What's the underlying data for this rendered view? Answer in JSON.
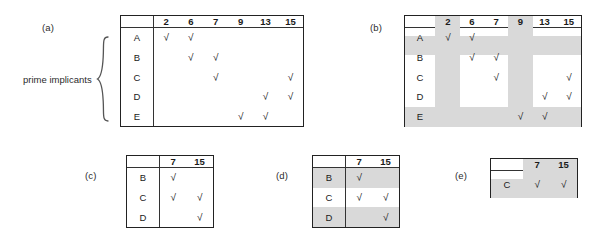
{
  "figure": {
    "side_label": "prime implicants",
    "panels": {
      "a": "(a)",
      "b": "(b)",
      "c": "(c)",
      "d": "(d)",
      "e": "(e)"
    }
  },
  "colors": {
    "highlight": "#d9d9d9",
    "border": "#222222",
    "text": "#1a1a1a"
  },
  "glyphs": {
    "check": "√"
  },
  "chart_data": {
    "type": "table",
    "tables": [
      {
        "id": "a",
        "label": "(a)",
        "corner": "",
        "columns": [
          "2",
          "6",
          "7",
          "9",
          "13",
          "15"
        ],
        "rows": [
          "A",
          "B",
          "C",
          "D",
          "E"
        ],
        "marks": [
          [
            1,
            1,
            0,
            0,
            0,
            0
          ],
          [
            0,
            1,
            1,
            0,
            0,
            0
          ],
          [
            0,
            0,
            1,
            0,
            0,
            1
          ],
          [
            0,
            0,
            0,
            0,
            1,
            1
          ],
          [
            0,
            0,
            0,
            1,
            1,
            0
          ]
        ],
        "highlight_columns": [],
        "highlight_rows": []
      },
      {
        "id": "b",
        "label": "(b)",
        "corner": "",
        "columns": [
          "2",
          "6",
          "7",
          "9",
          "13",
          "15"
        ],
        "rows": [
          "A",
          "B",
          "C",
          "D",
          "E"
        ],
        "marks": [
          [
            1,
            1,
            0,
            0,
            0,
            0
          ],
          [
            0,
            1,
            1,
            0,
            0,
            0
          ],
          [
            0,
            0,
            1,
            0,
            0,
            1
          ],
          [
            0,
            0,
            0,
            0,
            1,
            1
          ],
          [
            0,
            0,
            0,
            1,
            1,
            0
          ]
        ],
        "highlight_columns": [
          "2",
          "9"
        ],
        "highlight_rows": [
          "A",
          "E"
        ]
      },
      {
        "id": "c",
        "label": "(c)",
        "corner": "",
        "columns": [
          "7",
          "15"
        ],
        "rows": [
          "B",
          "C",
          "D"
        ],
        "marks": [
          [
            1,
            0
          ],
          [
            1,
            1
          ],
          [
            0,
            1
          ]
        ],
        "highlight_columns": [],
        "highlight_rows": []
      },
      {
        "id": "d",
        "label": "(d)",
        "corner": "",
        "columns": [
          "7",
          "15"
        ],
        "rows": [
          "B",
          "C",
          "D"
        ],
        "marks": [
          [
            1,
            0
          ],
          [
            1,
            1
          ],
          [
            0,
            1
          ]
        ],
        "highlight_columns": [],
        "highlight_rows": [
          "B",
          "D"
        ]
      },
      {
        "id": "e",
        "label": "(e)",
        "corner": "",
        "columns": [
          "7",
          "15"
        ],
        "rows": [
          "C"
        ],
        "marks": [
          [
            1,
            1
          ]
        ],
        "highlight_columns": [
          "7",
          "15"
        ],
        "highlight_rows": [
          "C"
        ]
      }
    ]
  }
}
